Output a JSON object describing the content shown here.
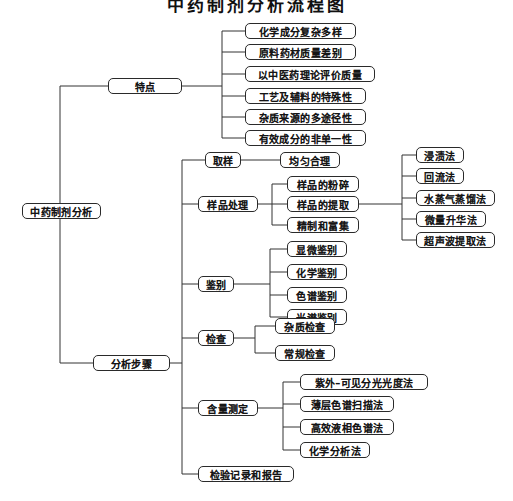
{
  "title": "中药制剂分析流程图",
  "root": {
    "label": "中药制剂分析",
    "x": 22,
    "y": 203,
    "w": 79,
    "h": 16,
    "fs": 10
  },
  "branches": [
    {
      "label": "特点",
      "x": 108,
      "y": 78,
      "w": 74,
      "h": 16,
      "fs": 10
    },
    {
      "label": "分析步骤",
      "x": 93,
      "y": 355,
      "w": 77,
      "h": 16,
      "fs": 10
    }
  ],
  "features": [
    {
      "label": "化学成分复杂多样",
      "x": 245,
      "y": 23,
      "w": 111,
      "h": 16,
      "fs": 10
    },
    {
      "label": "原料药材质量差别",
      "x": 245,
      "y": 44,
      "w": 111,
      "h": 16,
      "fs": 10
    },
    {
      "label": "以中医药理论评价质量",
      "x": 245,
      "y": 66,
      "w": 130,
      "h": 16,
      "fs": 10
    },
    {
      "label": "工艺及辅料的特殊性",
      "x": 245,
      "y": 88,
      "w": 121,
      "h": 16,
      "fs": 10
    },
    {
      "label": "杂质来源的多途径性",
      "x": 245,
      "y": 109,
      "w": 121,
      "h": 16,
      "fs": 10
    },
    {
      "label": "有效成分的非单一性",
      "x": 245,
      "y": 130,
      "w": 121,
      "h": 16,
      "fs": 10
    }
  ],
  "steps": [
    {
      "label": "取样",
      "x": 205,
      "y": 152,
      "w": 36,
      "h": 16,
      "fs": 10
    },
    {
      "label": "样品处理",
      "x": 198,
      "y": 196,
      "w": 60,
      "h": 16,
      "fs": 10
    },
    {
      "label": "鉴别",
      "x": 198,
      "y": 276,
      "w": 36,
      "h": 16,
      "fs": 10
    },
    {
      "label": "检查",
      "x": 198,
      "y": 330,
      "w": 36,
      "h": 16,
      "fs": 10
    },
    {
      "label": "含量测定",
      "x": 198,
      "y": 400,
      "w": 60,
      "h": 16,
      "fs": 10
    },
    {
      "label": "检验记录和报告",
      "x": 198,
      "y": 466,
      "w": 96,
      "h": 16,
      "fs": 10
    }
  ],
  "sampling_children": [
    {
      "label": "均匀合理",
      "x": 280,
      "y": 152,
      "w": 60,
      "h": 16,
      "fs": 10
    }
  ],
  "sample_treatment_children": [
    {
      "label": "样品的粉碎",
      "x": 287,
      "y": 176,
      "w": 72,
      "h": 16,
      "fs": 10
    },
    {
      "label": "样品的提取",
      "x": 287,
      "y": 196,
      "w": 72,
      "h": 16,
      "fs": 10
    },
    {
      "label": "精制和富集",
      "x": 287,
      "y": 217,
      "w": 72,
      "h": 16,
      "fs": 10
    }
  ],
  "extraction_methods": [
    {
      "label": "浸渍法",
      "x": 416,
      "y": 147,
      "w": 48,
      "h": 16,
      "fs": 10
    },
    {
      "label": "回流法",
      "x": 416,
      "y": 168,
      "w": 48,
      "h": 16,
      "fs": 10
    },
    {
      "label": "水蒸气蒸馏法",
      "x": 416,
      "y": 190,
      "w": 79,
      "h": 16,
      "fs": 10
    },
    {
      "label": "微量升华法",
      "x": 416,
      "y": 211,
      "w": 70,
      "h": 16,
      "fs": 10
    },
    {
      "label": "超声波提取法",
      "x": 416,
      "y": 232,
      "w": 79,
      "h": 16,
      "fs": 10
    }
  ],
  "identification_children": [
    {
      "label": "显微鉴别",
      "x": 287,
      "y": 241,
      "w": 60,
      "h": 16,
      "fs": 10
    },
    {
      "label": "化学鉴别",
      "x": 287,
      "y": 264,
      "w": 60,
      "h": 16,
      "fs": 10
    },
    {
      "label": "色谱鉴别",
      "x": 287,
      "y": 287,
      "w": 60,
      "h": 16,
      "fs": 10
    },
    {
      "label": "光谱鉴别",
      "x": 287,
      "y": 309,
      "w": 60,
      "h": 16,
      "fs": 10
    }
  ],
  "inspection_children": [
    {
      "label": "杂质检查",
      "x": 275,
      "y": 318,
      "w": 60,
      "h": 16,
      "fs": 10
    },
    {
      "label": "常规检查",
      "x": 275,
      "y": 345,
      "w": 60,
      "h": 16,
      "fs": 10
    }
  ],
  "assay_children": [
    {
      "label": "紫外–可见分光光度法",
      "x": 300,
      "y": 374,
      "w": 128,
      "h": 16,
      "fs": 10
    },
    {
      "label": "薄层色谱扫描法",
      "x": 300,
      "y": 396,
      "w": 94,
      "h": 16,
      "fs": 10
    },
    {
      "label": "高效液相色谱法",
      "x": 300,
      "y": 419,
      "w": 94,
      "h": 16,
      "fs": 10
    },
    {
      "label": "化学分析法",
      "x": 300,
      "y": 442,
      "w": 70,
      "h": 16,
      "fs": 10
    }
  ],
  "connectors": {
    "root_trunk_x": 60,
    "root_top_y": 86,
    "root_bottom_y": 363,
    "feature_trunk_x": 222,
    "steps_trunk_x": 182,
    "treat_trunk_x": 272,
    "extract_trunk_x": 402,
    "ident_trunk_x": 270,
    "insp_trunk_x": 255,
    "assay_trunk_x": 283
  }
}
